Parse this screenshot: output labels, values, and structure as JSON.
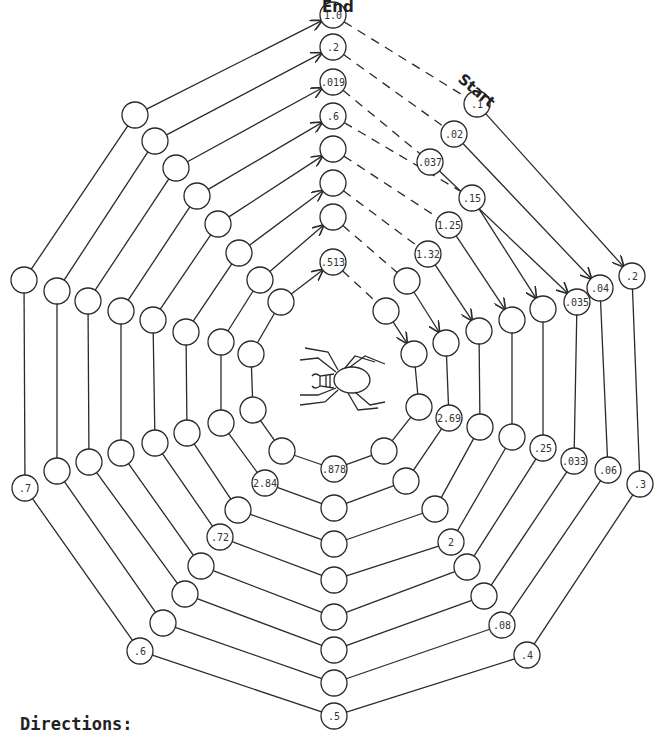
{
  "labels": {
    "end": "End",
    "start": "Start",
    "directions": "Directions:"
  },
  "colors": {
    "line": "#2a2a2a",
    "text": "#333333",
    "background": "#ffffff"
  },
  "node_radius": 13,
  "rings": [
    {
      "ring": 1,
      "nodes": [
        {
          "pos": "top",
          "x": 333,
          "y": 15,
          "label": "1.0"
        },
        {
          "pos": "ne",
          "x": 477,
          "y": 104,
          "label": ".1"
        },
        {
          "pos": "e_up",
          "x": 632,
          "y": 276,
          "label": ".2"
        },
        {
          "pos": "e_low",
          "x": 640,
          "y": 484,
          "label": ".3"
        },
        {
          "pos": "se",
          "x": 527,
          "y": 655,
          "label": ".4"
        },
        {
          "pos": "bottom",
          "x": 334,
          "y": 716,
          "label": ".5"
        },
        {
          "pos": "sw",
          "x": 140,
          "y": 651,
          "label": ".6"
        },
        {
          "pos": "w_low",
          "x": 25,
          "y": 488,
          "label": ".7"
        },
        {
          "pos": "w_up",
          "x": 24,
          "y": 280,
          "label": ""
        },
        {
          "pos": "nw",
          "x": 135,
          "y": 115,
          "label": ""
        }
      ]
    },
    {
      "ring": 2,
      "nodes": [
        {
          "pos": "top",
          "x": 333,
          "y": 47,
          "label": ".2"
        },
        {
          "pos": "ne",
          "x": 454,
          "y": 134,
          "label": ".02"
        },
        {
          "pos": "e_up",
          "x": 600,
          "y": 288,
          "label": ".04"
        },
        {
          "pos": "e_low",
          "x": 608,
          "y": 470,
          "label": ".06"
        },
        {
          "pos": "se",
          "x": 502,
          "y": 625,
          "label": ".08"
        },
        {
          "pos": "bottom",
          "x": 334,
          "y": 683,
          "label": ""
        },
        {
          "pos": "sw",
          "x": 163,
          "y": 623,
          "label": ""
        },
        {
          "pos": "w_low",
          "x": 57,
          "y": 471,
          "label": ""
        },
        {
          "pos": "w_up",
          "x": 57,
          "y": 291,
          "label": ""
        },
        {
          "pos": "nw",
          "x": 155,
          "y": 141,
          "label": ""
        }
      ]
    },
    {
      "ring": 3,
      "nodes": [
        {
          "pos": "top",
          "x": 333,
          "y": 82,
          "label": ".019"
        },
        {
          "pos": "ne",
          "x": 430,
          "y": 162,
          "label": ".037"
        },
        {
          "pos": "e_up",
          "x": 577,
          "y": 302,
          "label": ".035"
        },
        {
          "pos": "e_low",
          "x": 574,
          "y": 461,
          "label": ".033"
        },
        {
          "pos": "se",
          "x": 484,
          "y": 596,
          "label": ""
        },
        {
          "pos": "bottom",
          "x": 334,
          "y": 650,
          "label": ""
        },
        {
          "pos": "sw",
          "x": 185,
          "y": 594,
          "label": ""
        },
        {
          "pos": "w_low",
          "x": 89,
          "y": 462,
          "label": ""
        },
        {
          "pos": "w_up",
          "x": 88,
          "y": 301,
          "label": ""
        },
        {
          "pos": "nw",
          "x": 176,
          "y": 168,
          "label": ""
        }
      ]
    },
    {
      "ring": 4,
      "nodes": [
        {
          "pos": "top",
          "x": 333,
          "y": 116,
          "label": ".6"
        },
        {
          "pos": "ne",
          "x": 472,
          "y": 198,
          "label": ".15"
        },
        {
          "pos": "e_up",
          "x": 543,
          "y": 309,
          "label": ""
        },
        {
          "pos": "e_low",
          "x": 543,
          "y": 448,
          "label": ".25"
        },
        {
          "pos": "se",
          "x": 467,
          "y": 567,
          "label": ""
        },
        {
          "pos": "bottom",
          "x": 334,
          "y": 617,
          "label": ""
        },
        {
          "pos": "sw",
          "x": 201,
          "y": 566,
          "label": ""
        },
        {
          "pos": "w_low",
          "x": 121,
          "y": 453,
          "label": ""
        },
        {
          "pos": "w_up",
          "x": 121,
          "y": 311,
          "label": ""
        },
        {
          "pos": "nw",
          "x": 197,
          "y": 196,
          "label": ""
        }
      ]
    },
    {
      "ring": 5,
      "nodes": [
        {
          "pos": "top",
          "x": 333,
          "y": 149,
          "label": ""
        },
        {
          "pos": "ne",
          "x": 449,
          "y": 225,
          "label": "1.25"
        },
        {
          "pos": "e_up",
          "x": 512,
          "y": 320,
          "label": ""
        },
        {
          "pos": "e_low",
          "x": 512,
          "y": 437,
          "label": ""
        },
        {
          "pos": "se",
          "x": 451,
          "y": 542,
          "label": "2"
        },
        {
          "pos": "bottom",
          "x": 334,
          "y": 580,
          "label": ""
        },
        {
          "pos": "sw",
          "x": 220,
          "y": 537,
          "label": ".72"
        },
        {
          "pos": "w_low",
          "x": 155,
          "y": 443,
          "label": ""
        },
        {
          "pos": "w_up",
          "x": 153,
          "y": 320,
          "label": ""
        },
        {
          "pos": "nw",
          "x": 218,
          "y": 224,
          "label": ""
        }
      ]
    },
    {
      "ring": 6,
      "nodes": [
        {
          "pos": "top",
          "x": 333,
          "y": 183,
          "label": ""
        },
        {
          "pos": "ne",
          "x": 428,
          "y": 254,
          "label": "1.32"
        },
        {
          "pos": "e_up",
          "x": 479,
          "y": 331,
          "label": ""
        },
        {
          "pos": "e_low",
          "x": 480,
          "y": 427,
          "label": ""
        },
        {
          "pos": "se",
          "x": 435,
          "y": 509,
          "label": ""
        },
        {
          "pos": "bottom",
          "x": 334,
          "y": 544,
          "label": ""
        },
        {
          "pos": "sw",
          "x": 238,
          "y": 510,
          "label": ""
        },
        {
          "pos": "w_low",
          "x": 187,
          "y": 433,
          "label": ""
        },
        {
          "pos": "w_up",
          "x": 186,
          "y": 332,
          "label": ""
        },
        {
          "pos": "nw",
          "x": 239,
          "y": 253,
          "label": ""
        }
      ]
    },
    {
      "ring": 7,
      "nodes": [
        {
          "pos": "top",
          "x": 333,
          "y": 217,
          "label": ""
        },
        {
          "pos": "ne",
          "x": 407,
          "y": 281,
          "label": ""
        },
        {
          "pos": "e_up",
          "x": 446,
          "y": 343,
          "label": ""
        },
        {
          "pos": "e_low",
          "x": 449,
          "y": 418,
          "label": "2.69"
        },
        {
          "pos": "se",
          "x": 406,
          "y": 481,
          "label": ""
        },
        {
          "pos": "bottom",
          "x": 334,
          "y": 508,
          "label": ""
        },
        {
          "pos": "sw",
          "x": 265,
          "y": 483,
          "label": "2.84"
        },
        {
          "pos": "w_low",
          "x": 221,
          "y": 423,
          "label": ""
        },
        {
          "pos": "w_up",
          "x": 221,
          "y": 342,
          "label": ""
        },
        {
          "pos": "nw",
          "x": 260,
          "y": 280,
          "label": ""
        }
      ]
    },
    {
      "ring": 8,
      "nodes": [
        {
          "pos": "top",
          "x": 333,
          "y": 262,
          "label": ".513"
        },
        {
          "pos": "ne",
          "x": 386,
          "y": 311,
          "label": ""
        },
        {
          "pos": "e_up",
          "x": 414,
          "y": 354,
          "label": ""
        },
        {
          "pos": "e_low",
          "x": 419,
          "y": 407,
          "label": ""
        },
        {
          "pos": "se",
          "x": 384,
          "y": 451,
          "label": ""
        },
        {
          "pos": "bottom",
          "x": 334,
          "y": 469,
          "label": ".878"
        },
        {
          "pos": "sw",
          "x": 282,
          "y": 451,
          "label": ""
        },
        {
          "pos": "w_low",
          "x": 253,
          "y": 410,
          "label": ""
        },
        {
          "pos": "w_up",
          "x": 251,
          "y": 354,
          "label": ""
        },
        {
          "pos": "nw",
          "x": 281,
          "y": 302,
          "label": ""
        }
      ]
    }
  ]
}
